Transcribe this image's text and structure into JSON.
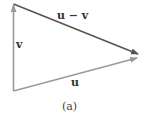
{
  "diagram": {
    "labels": {
      "u_minus_v": "u − v",
      "v": "v",
      "u": "u"
    },
    "caption": "(a)",
    "colors": {
      "u_minus_v": "#555555",
      "v": "#9a9a9a",
      "u": "#9a9a9a",
      "text": "#333333"
    }
  }
}
